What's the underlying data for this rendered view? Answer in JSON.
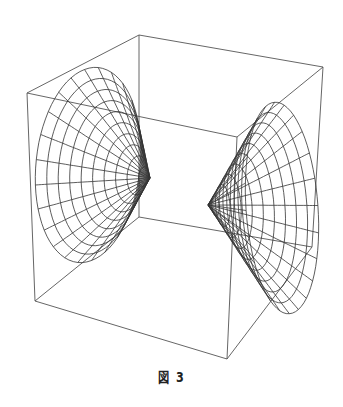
{
  "figure": {
    "caption": "図 3",
    "line_color": "#333333",
    "box": {
      "top_back_left": [
        139,
        35
      ],
      "top_front_left": [
        27,
        93
      ],
      "top_front_right": [
        237,
        137
      ],
      "top_back_right": [
        323,
        67
      ],
      "bottom_back_left": [
        139,
        217
      ],
      "bottom_front_left": [
        35,
        301
      ],
      "bottom_front_right": [
        227,
        359
      ],
      "bottom_back_right": [
        312,
        247
      ]
    },
    "surfaces": [
      {
        "name": "left-sheet",
        "apex": [
          150,
          178
        ],
        "rim_center": [
          88,
          165
        ],
        "rim_rx": 52,
        "rim_ry": 98,
        "rim_rotate": 6,
        "radial_lines": 24,
        "rings": 10
      },
      {
        "name": "right-sheet",
        "apex": [
          208,
          205
        ],
        "rim_center": [
          282,
          208
        ],
        "rim_rx": 36,
        "rim_ry": 106,
        "rim_rotate": -4,
        "radial_lines": 24,
        "rings": 10
      }
    ]
  }
}
